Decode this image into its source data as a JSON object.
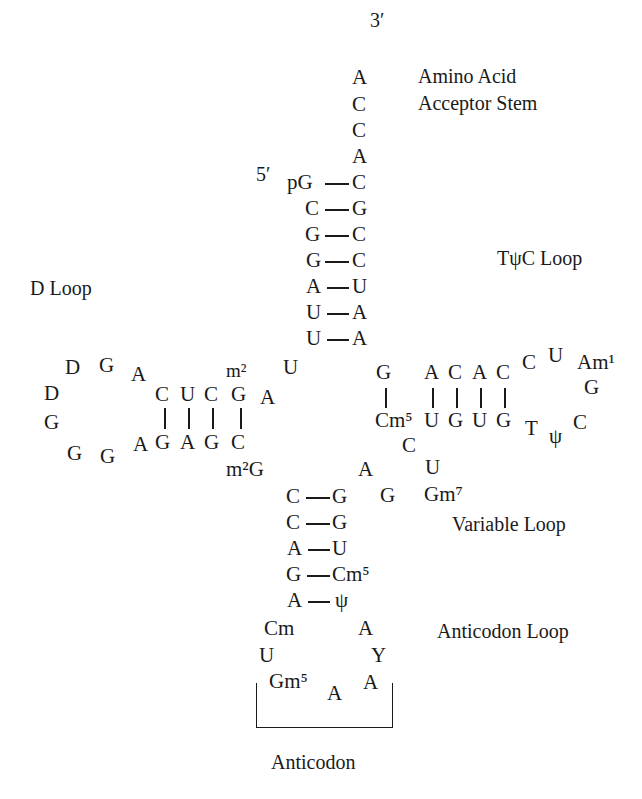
{
  "labels": {
    "three_prime": "3′",
    "five_prime": "5′",
    "amino_acid_line1": "Amino Acid",
    "amino_acid_line2": "Acceptor Stem",
    "tpsic_loop": "TψC Loop",
    "d_loop": "D Loop",
    "variable_loop": "Variable Loop",
    "anticodon_loop": "Anticodon Loop",
    "anticodon": "Anticodon"
  },
  "acceptor_stem": {
    "overhang": [
      "A",
      "C",
      "C",
      "A"
    ],
    "pairs": [
      [
        "pG",
        "C"
      ],
      [
        "C",
        "G"
      ],
      [
        "G",
        "C"
      ],
      [
        "G",
        "C"
      ],
      [
        "A",
        "U"
      ],
      [
        "U",
        "A"
      ],
      [
        "U",
        "A"
      ]
    ]
  },
  "d_arm": {
    "top_strand": [
      "C",
      "U",
      "C",
      "G"
    ],
    "bottom_strand": [
      "G",
      "A",
      "G",
      "C"
    ],
    "loop": [
      "A",
      "G",
      "D",
      "D",
      "G",
      "G",
      "G",
      "A"
    ],
    "m2_top": "m²",
    "junction_A": "A",
    "junction_U": "U",
    "m2G": "m²G"
  },
  "t_arm": {
    "top_strand": [
      "G",
      "A",
      "C",
      "A",
      "C"
    ],
    "bottom_strand": [
      "Cm⁵",
      "U",
      "G",
      "U",
      "G"
    ],
    "loop": [
      "C",
      "U",
      "Am¹",
      "G",
      "C",
      "ψ",
      "T"
    ]
  },
  "variable_loop": [
    "A",
    "G",
    "Gm⁷",
    "U",
    "C"
  ],
  "anticodon_stem": {
    "pairs": [
      [
        "C",
        "G"
      ],
      [
        "C",
        "G"
      ],
      [
        "A",
        "U"
      ],
      [
        "G",
        "Cm⁵"
      ],
      [
        "A",
        "ψ"
      ]
    ]
  },
  "anticodon_loop": [
    "Cm",
    "U",
    "Gm⁵",
    "A",
    "A",
    "Y",
    "A"
  ]
}
